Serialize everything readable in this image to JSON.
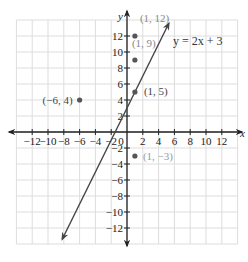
{
  "chart_data": {
    "type": "scatter",
    "title": "",
    "xlabel": "x",
    "ylabel": "y",
    "xlim": [
      -14,
      14
    ],
    "ylim": [
      -14,
      14
    ],
    "grid": true,
    "grid_step": 2,
    "x_ticks": [
      -12,
      -10,
      -8,
      -6,
      -4,
      -2,
      0,
      2,
      4,
      6,
      8,
      10,
      12
    ],
    "y_ticks": [
      -12,
      -10,
      -8,
      -6,
      -4,
      -2,
      2,
      4,
      6,
      8,
      10,
      12
    ],
    "x_tick_labels": [
      "−12",
      "−10",
      "−8",
      "−6",
      "−4",
      "−2",
      "0",
      "2",
      "4",
      "6",
      "8",
      "10",
      "12"
    ],
    "y_tick_labels": [
      "−12",
      "−10",
      "−8",
      "−6",
      "−4",
      "−2",
      "2",
      "4",
      "6",
      "8",
      "10",
      "12"
    ],
    "line": {
      "label": "y = 2x + 3",
      "slope": 2,
      "intercept": 3,
      "x_range": [
        -8.2,
        5.3
      ],
      "color": "#444444"
    },
    "points": [
      {
        "x": 1,
        "y": 12,
        "label": "(1, 12)",
        "label_color": "#888888"
      },
      {
        "x": 1,
        "y": 9,
        "label": "(1, 9)",
        "label_color": "#888888"
      },
      {
        "x": 1,
        "y": 5,
        "label": "(1, 5)",
        "label_color": "#444444"
      },
      {
        "x": -6,
        "y": 4,
        "label": "(−6, 4)",
        "label_color": "#444444"
      },
      {
        "x": 1,
        "y": -3,
        "label": "(1, −3)",
        "label_color": "#999999"
      }
    ],
    "colors": {
      "grid": "#dddddd",
      "axis": "#222222",
      "point": "#555555"
    }
  }
}
